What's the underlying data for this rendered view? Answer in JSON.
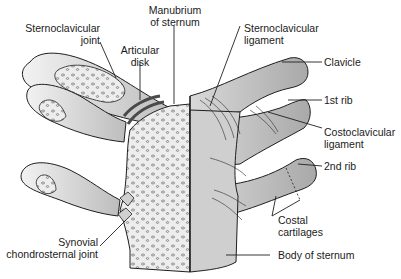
{
  "diagram": {
    "colors": {
      "bone_light": "#e6e6e6",
      "bone_mid": "#c9c9c9",
      "bone_dark": "#9e9e9e",
      "outline": "#1f1f1f",
      "disk": "#4a4a4a",
      "background": "#ffffff"
    },
    "labels": {
      "sternoclavicular_joint": [
        "Sternoclavicular",
        "joint"
      ],
      "articular_disk": [
        "Articular",
        "disk"
      ],
      "manubrium": [
        "Manubrium",
        "of sternum"
      ],
      "sternoclavicular_ligament": [
        "Sternoclavicular",
        "ligament"
      ],
      "clavicle": [
        "Clavicle"
      ],
      "first_rib": [
        "1st rib"
      ],
      "costoclavicular_ligament": [
        "Costoclavicular",
        "ligament"
      ],
      "second_rib": [
        "2nd rib"
      ],
      "costal_cartilages": [
        "Costal",
        "cartilages"
      ],
      "synovial_chondrosternal_joint": [
        "Synovial",
        "chondrosternal joint"
      ],
      "body_of_sternum": [
        "Body of sternum"
      ]
    }
  }
}
